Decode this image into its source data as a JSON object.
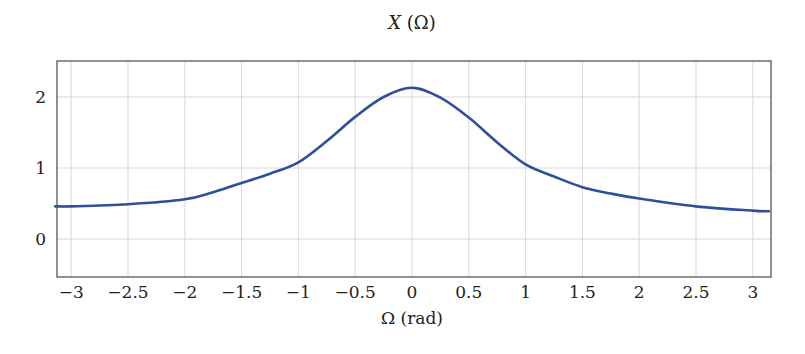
{
  "chart_data": {
    "type": "line",
    "title": "X (Ω)",
    "title_parts": {
      "italic": "X",
      "rest": " (Ω)"
    },
    "xlabel": "Ω (rad)",
    "ylabel": "",
    "xlim": [
      -3.1416,
      3.1416
    ],
    "ylim": [
      -0.53,
      2.5
    ],
    "grid": true,
    "legend": null,
    "x_ticks": [
      -3,
      -2.5,
      -2,
      -1.5,
      -1,
      -0.5,
      0,
      0.5,
      1,
      1.5,
      2,
      2.5,
      3
    ],
    "x_tick_labels": [
      "−3",
      "−2.5",
      "−2",
      "−1.5",
      "−1",
      "−0.5",
      "0",
      "0.5",
      "1",
      "1.5",
      "2",
      "2.5",
      "3"
    ],
    "y_ticks": [
      0,
      1,
      2
    ],
    "y_tick_labels": [
      "0",
      "1",
      "2"
    ],
    "series": [
      {
        "name": "X(Ω)",
        "color": "#2f4f9a",
        "x": [
          -3.1416,
          -3.0,
          -2.5,
          -2.0,
          -1.75,
          -1.5,
          -1.25,
          -1.0,
          -0.75,
          -0.5,
          -0.25,
          0.0,
          0.25,
          0.5,
          0.75,
          1.0,
          1.25,
          1.5,
          1.75,
          2.0,
          2.5,
          3.0,
          3.1416
        ],
        "values": [
          0.46,
          0.46,
          0.49,
          0.56,
          0.66,
          0.79,
          0.92,
          1.08,
          1.38,
          1.72,
          2.0,
          2.13,
          1.99,
          1.71,
          1.36,
          1.05,
          0.88,
          0.73,
          0.64,
          0.57,
          0.46,
          0.4,
          0.39
        ]
      }
    ]
  }
}
